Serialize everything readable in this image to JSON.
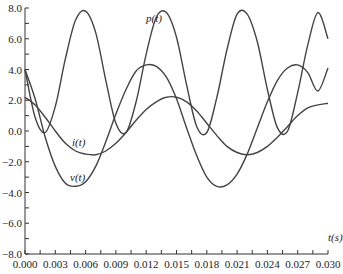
{
  "chart_data": {
    "type": "line",
    "title": "",
    "xlabel": "t(s)",
    "ylabel": "",
    "xlim": [
      0.0,
      0.03
    ],
    "ylim": [
      -8.0,
      8.0
    ],
    "grid": false,
    "legend": "inline labels",
    "x_ticks": [
      "0.000",
      "0.003",
      "0.006",
      "0.009",
      "0.012",
      "0.015",
      "0.018",
      "0.021",
      "0.024",
      "0.027",
      "0.030"
    ],
    "y_ticks": [
      "8.0",
      "6.0",
      "4.0",
      "2.0",
      "0.0",
      "-2.0",
      "-4.0",
      "-6.0",
      "-8.0"
    ],
    "x": [
      0.0,
      0.001,
      0.002,
      0.003,
      0.004,
      0.005,
      0.006,
      0.007,
      0.008,
      0.009,
      0.01,
      0.011,
      0.012,
      0.013,
      0.014,
      0.015,
      0.016,
      0.017,
      0.018,
      0.019,
      0.02,
      0.021,
      0.022,
      0.023,
      0.024,
      0.025,
      0.026,
      0.027,
      0.028,
      0.029,
      0.03
    ],
    "series": [
      {
        "name": "p(t)",
        "label": "p(t)",
        "values": [
          4.0,
          0.9,
          -0.1,
          1.6,
          4.7,
          7.2,
          7.8,
          6.4,
          3.3,
          0.5,
          -0.1,
          1.9,
          5.0,
          7.4,
          7.7,
          6.1,
          3.0,
          0.3,
          -0.1,
          2.2,
          5.3,
          7.6,
          7.6,
          5.8,
          2.7,
          0.2,
          0.0,
          2.5,
          5.6,
          7.7,
          6.0
        ]
      },
      {
        "name": "v(t)",
        "label": "v(t)",
        "values": [
          4.0,
          2.1,
          -0.4,
          -2.3,
          -3.4,
          -3.6,
          -3.3,
          -2.3,
          -0.7,
          1.1,
          2.7,
          3.9,
          4.3,
          4.2,
          3.5,
          2.1,
          0.2,
          -1.6,
          -3.0,
          -3.6,
          -3.5,
          -2.8,
          -1.5,
          0.2,
          1.9,
          3.3,
          4.1,
          4.3,
          3.8,
          2.6,
          4.1
        ]
      },
      {
        "name": "i(t)",
        "label": "i(t)",
        "values": [
          2.2,
          1.7,
          0.9,
          0.0,
          -0.8,
          -1.3,
          -1.5,
          -1.55,
          -1.3,
          -0.8,
          -0.1,
          0.7,
          1.4,
          1.9,
          2.2,
          2.2,
          1.9,
          1.3,
          0.5,
          -0.3,
          -1.0,
          -1.4,
          -1.55,
          -1.4,
          -1.0,
          -0.4,
          0.3,
          1.0,
          1.5,
          1.7,
          1.8
        ]
      }
    ]
  },
  "labels": {
    "p": "p(t)",
    "v": "v(t)",
    "i": "i(t)",
    "t_axis": "t(s)"
  }
}
